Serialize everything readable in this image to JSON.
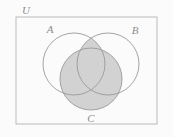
{
  "figure": {
    "name": "venn-diagram-three-sets",
    "width": 173,
    "height": 137,
    "background_color": "#fbfbfb",
    "shaded_expression": "(A and B) or C",
    "shaded_regions": [
      "A-intersect-B",
      "C",
      "A-intersect-C",
      "B-intersect-C",
      "A-intersect-B-intersect-C"
    ],
    "unshaded_regions": [
      "A-only",
      "B-only",
      "outside-all-sets"
    ]
  },
  "colors": {
    "background": "#fbfbfb",
    "universe_border": "#bbbbbb",
    "circle_stroke": "#9a9a9a",
    "shade_fill": "#d2d2d2",
    "label_text": "#8d8d8d"
  },
  "universe": {
    "label": "U",
    "label_x": 26,
    "label_y": 14,
    "rect_x": 16,
    "rect_y": 17,
    "rect_width": 141,
    "rect_height": 107
  },
  "circles": [
    {
      "id": "A",
      "label": "A",
      "cx": 74,
      "cy": 64,
      "r": 31,
      "label_x": 50,
      "label_y": 33,
      "filled": false
    },
    {
      "id": "B",
      "label": "B",
      "cx": 108,
      "cy": 64,
      "r": 31,
      "label_x": 135,
      "label_y": 34,
      "filled": false
    },
    {
      "id": "C",
      "label": "C",
      "cx": 91,
      "cy": 79,
      "r": 31,
      "label_x": 91,
      "label_y": 122,
      "filled": true
    }
  ]
}
